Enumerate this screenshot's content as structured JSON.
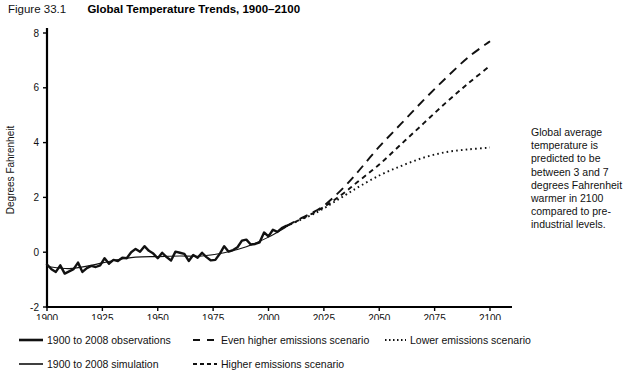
{
  "header": {
    "figure_number": "Figure 33.1",
    "title": "Global Temperature Trends, 1900–2100"
  },
  "annotation": {
    "text": "Global average temperature is predicted to be between 3 and 7 degrees Fahrenheit warmer in 2100 compared to pre-industrial levels."
  },
  "legend": {
    "rows": [
      [
        {
          "label": "1900 to 2008 observations",
          "style": "solid-thick",
          "x": 18
        },
        {
          "label": "Even higher emissions scenario",
          "style": "long-dash",
          "x": 192
        },
        {
          "label": "Lower emissions scenario",
          "style": "dotted",
          "x": 381
        }
      ],
      [
        {
          "label": "1900 to 2008 simulation",
          "style": "solid-thin",
          "x": 18
        },
        {
          "label": "Higher emissions scenario",
          "style": "short-dash",
          "x": 192
        }
      ]
    ]
  },
  "chart_data": {
    "type": "line",
    "title": "Global Temperature Trends, 1900–2100",
    "xlabel": "",
    "ylabel": "Degrees Fahrenheit",
    "xlim": [
      1900,
      2100
    ],
    "ylim": [
      -2,
      8
    ],
    "xticks": [
      1900,
      1925,
      1950,
      1975,
      2000,
      2025,
      2050,
      2075,
      2100
    ],
    "yticks": [
      -2,
      0,
      2,
      4,
      6,
      8
    ],
    "grid": false,
    "legend_position": "below",
    "series": [
      {
        "name": "1900 to 2008 observations",
        "style": "solid-thick",
        "x": [
          1900,
          1902,
          1904,
          1906,
          1908,
          1910,
          1912,
          1914,
          1916,
          1918,
          1920,
          1922,
          1924,
          1926,
          1928,
          1930,
          1932,
          1934,
          1936,
          1938,
          1940,
          1942,
          1944,
          1946,
          1948,
          1950,
          1952,
          1954,
          1956,
          1958,
          1960,
          1962,
          1964,
          1966,
          1968,
          1970,
          1972,
          1974,
          1976,
          1978,
          1980,
          1982,
          1984,
          1986,
          1988,
          1990,
          1992,
          1994,
          1996,
          1998,
          2000,
          2002,
          2004,
          2006,
          2008
        ],
        "y": [
          -0.45,
          -0.62,
          -0.72,
          -0.48,
          -0.78,
          -0.7,
          -0.62,
          -0.38,
          -0.72,
          -0.58,
          -0.5,
          -0.54,
          -0.48,
          -0.22,
          -0.42,
          -0.28,
          -0.32,
          -0.2,
          -0.22,
          0.0,
          0.12,
          0.02,
          0.22,
          0.05,
          -0.05,
          -0.22,
          -0.02,
          -0.18,
          -0.3,
          0.02,
          -0.02,
          -0.06,
          -0.32,
          -0.1,
          -0.2,
          -0.02,
          -0.18,
          -0.3,
          -0.28,
          -0.06,
          0.22,
          0.02,
          0.08,
          0.18,
          0.42,
          0.46,
          0.28,
          0.3,
          0.36,
          0.72,
          0.58,
          0.82,
          0.74,
          0.88,
          0.96
        ]
      },
      {
        "name": "1900 to 2008 simulation",
        "style": "solid-thin",
        "x": [
          1900,
          1910,
          1920,
          1930,
          1940,
          1950,
          1960,
          1970,
          1980,
          1990,
          2000,
          2008
        ],
        "y": [
          -0.52,
          -0.6,
          -0.48,
          -0.3,
          -0.18,
          -0.16,
          -0.14,
          -0.14,
          -0.02,
          0.2,
          0.55,
          0.92
        ]
      },
      {
        "name": "Even higher emissions scenario",
        "style": "long-dash",
        "x": [
          2008,
          2015,
          2020,
          2025,
          2030,
          2035,
          2040,
          2050,
          2060,
          2070,
          2080,
          2090,
          2100
        ],
        "y": [
          0.95,
          1.25,
          1.45,
          1.7,
          2.05,
          2.45,
          2.9,
          3.85,
          4.7,
          5.55,
          6.35,
          7.1,
          7.7
        ]
      },
      {
        "name": "Higher emissions scenario",
        "style": "short-dash",
        "x": [
          2008,
          2015,
          2020,
          2025,
          2030,
          2035,
          2040,
          2050,
          2060,
          2070,
          2080,
          2090,
          2100
        ],
        "y": [
          0.95,
          1.22,
          1.42,
          1.65,
          1.92,
          2.22,
          2.55,
          3.2,
          3.95,
          4.7,
          5.45,
          6.15,
          6.8
        ]
      },
      {
        "name": "Lower emissions scenario",
        "style": "dotted",
        "x": [
          2008,
          2015,
          2020,
          2025,
          2030,
          2035,
          2040,
          2050,
          2060,
          2070,
          2080,
          2090,
          2100
        ],
        "y": [
          0.95,
          1.2,
          1.38,
          1.6,
          1.85,
          2.1,
          2.35,
          2.8,
          3.15,
          3.45,
          3.65,
          3.75,
          3.82
        ]
      }
    ]
  }
}
